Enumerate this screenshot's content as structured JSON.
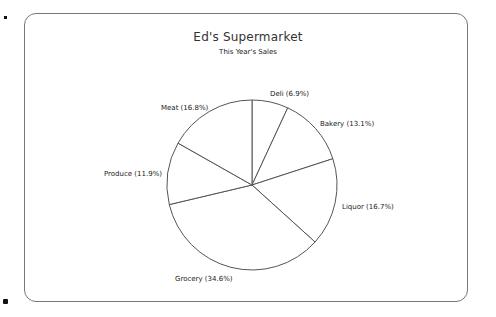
{
  "chart_data": {
    "type": "pie",
    "title": "Ed's Supermarket",
    "subtitle": "This Year's Sales",
    "start_angle": "12 o'clock, clockwise",
    "slices": [
      {
        "label": "Deli",
        "value": 6.9,
        "text": "Deli (6.9%)"
      },
      {
        "label": "Bakery",
        "value": 13.1,
        "text": "Bakery (13.1%)"
      },
      {
        "label": "Liquor",
        "value": 16.7,
        "text": "Liquor (16.7%)"
      },
      {
        "label": "Grocery",
        "value": 34.6,
        "text": "Grocery (34.6%)"
      },
      {
        "label": "Produce",
        "value": 11.9,
        "text": "Produce (11.9%)"
      },
      {
        "label": "Meat",
        "value": 16.8,
        "text": "Meat (16.8%)"
      }
    ],
    "fill": "#ffffff",
    "stroke": "#555555",
    "legend": "none (labels outside slices)"
  },
  "colors": {
    "frame": "#777777",
    "line": "#555555",
    "text": "#222222"
  }
}
